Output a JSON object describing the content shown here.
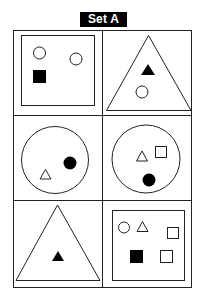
{
  "title": "Set A",
  "grid": {
    "rows": 3,
    "cols": 2
  },
  "cells": [
    {
      "position": "row1-col1",
      "container": "square",
      "contents": [
        "outline circle",
        "outline circle",
        "filled square"
      ]
    },
    {
      "position": "row1-col2",
      "container": "triangle",
      "contents": [
        "filled triangle",
        "outline circle"
      ]
    },
    {
      "position": "row2-col1",
      "container": "circle",
      "contents": [
        "outline triangle",
        "filled circle"
      ]
    },
    {
      "position": "row2-col2",
      "container": "circle",
      "contents": [
        "outline triangle",
        "outline square",
        "filled circle"
      ]
    },
    {
      "position": "row3-col1",
      "container": "triangle",
      "contents": [
        "filled triangle"
      ]
    },
    {
      "position": "row3-col2",
      "container": "square",
      "contents": [
        "outline circle",
        "outline triangle",
        "outline square",
        "filled square",
        "outline square"
      ]
    }
  ],
  "colors": {
    "stroke": "#222222",
    "fill": "#000000",
    "background": "#ffffff"
  }
}
